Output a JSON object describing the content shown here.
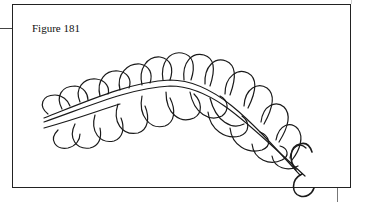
{
  "figure": {
    "caption": "Figure 181",
    "stroke_color": "#1a1a1a",
    "frame_color": "#222222"
  }
}
